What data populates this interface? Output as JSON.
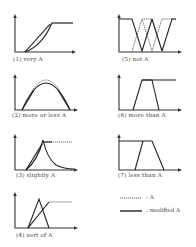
{
  "figure": {
    "panels": [
      {
        "id": "1",
        "number": "(1)",
        "label": "very  A",
        "hedge": "very"
      },
      {
        "id": "2",
        "number": "(2)",
        "label": "more  or  less  A",
        "hedge": "more or less"
      },
      {
        "id": "3",
        "number": "(3)",
        "label": "slightly  A",
        "hedge": "slightly"
      },
      {
        "id": "4",
        "number": "(4)",
        "label": "sort  of  A",
        "hedge": "sort of"
      },
      {
        "id": "5",
        "number": "(5)",
        "label": "not  A",
        "hedge": "not"
      },
      {
        "id": "6",
        "number": "(6)",
        "label": "more than  A",
        "hedge": "more than"
      },
      {
        "id": "7",
        "number": "(7)",
        "label": "less than  A",
        "hedge": "less than"
      }
    ],
    "legend": {
      "items": [
        {
          "style": "dotted",
          "text": ": A"
        },
        {
          "style": "solid",
          "text": ": modified A"
        }
      ]
    }
  },
  "text": {
    "p1": "(1)   very   A",
    "p2": "(2)   more   or   less   A",
    "p3": "(3)   slightly   A",
    "p4": "(4)   sort   of   A",
    "p5": "(5)   not   A",
    "p6": "(6)   more than   A",
    "p7": "(7)   less than   A",
    "legend_a": ": A",
    "legend_mod": ": modified A"
  }
}
